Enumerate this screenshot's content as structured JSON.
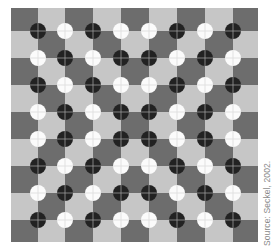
{
  "figure": {
    "type": "checkerboard-illusion",
    "grid": {
      "x_edges": [
        11,
        38,
        65,
        93,
        121,
        149,
        177,
        205,
        233,
        258
      ],
      "y_edges": [
        8,
        31,
        58,
        85,
        112,
        139,
        166,
        193,
        220,
        242
      ],
      "top_left_shade": "dark"
    },
    "colors": {
      "dark_square": "#6d6d6d",
      "light_square": "#c6c6c6",
      "black_disc": "#222222",
      "white_disc": "#fbfbfb",
      "crosshair_on_black": "#9a9a9a",
      "crosshair_on_white": "#dcdcdc"
    },
    "disc_radius": 8,
    "disc_rows": [
      [
        "B",
        "W",
        "B",
        "W",
        "W",
        "B",
        "W",
        "B"
      ],
      [
        "W",
        "B",
        "W",
        "B",
        "B",
        "W",
        "B",
        "W"
      ],
      [
        "B",
        "W",
        "B",
        "W",
        "W",
        "B",
        "W",
        "B"
      ],
      [
        "W",
        "B",
        "W",
        "B",
        "B",
        "W",
        "B",
        "W"
      ],
      [
        "W",
        "B",
        "W",
        "B",
        "B",
        "W",
        "B",
        "W"
      ],
      [
        "B",
        "W",
        "B",
        "W",
        "W",
        "B",
        "W",
        "B"
      ],
      [
        "W",
        "B",
        "W",
        "B",
        "B",
        "W",
        "B",
        "W"
      ],
      [
        "B",
        "W",
        "B",
        "W",
        "W",
        "B",
        "W",
        "B"
      ]
    ]
  },
  "caption": {
    "source": "Source: Seckel, 2002."
  }
}
